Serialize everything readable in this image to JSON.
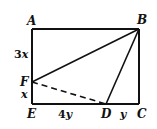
{
  "figure": {
    "points": {
      "A": "A",
      "B": "B",
      "C": "C",
      "D": "D",
      "E": "E",
      "F": "F"
    },
    "lengths": {
      "AF": {
        "coef": "3",
        "var": "x"
      },
      "FE": {
        "coef": "",
        "var": "x"
      },
      "ED": {
        "coef": "4",
        "var": "y"
      },
      "DC": {
        "coef": "",
        "var": "y"
      }
    },
    "segments": [
      {
        "from": "A",
        "to": "B",
        "style": "solid"
      },
      {
        "from": "B",
        "to": "C",
        "style": "solid"
      },
      {
        "from": "C",
        "to": "E",
        "style": "solid"
      },
      {
        "from": "E",
        "to": "A",
        "style": "solid"
      },
      {
        "from": "F",
        "to": "B",
        "style": "solid"
      },
      {
        "from": "D",
        "to": "B",
        "style": "solid"
      },
      {
        "from": "F",
        "to": "D",
        "style": "dashed"
      }
    ]
  }
}
